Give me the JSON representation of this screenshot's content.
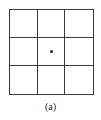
{
  "figure": {
    "caption": "(a)",
    "grid": {
      "rows": 3,
      "cols": 3,
      "line_color": "#3a3a3a",
      "center_marker": {
        "row": 1,
        "col": 1,
        "symbol": "dot",
        "color": "#2a2a2a"
      }
    }
  }
}
